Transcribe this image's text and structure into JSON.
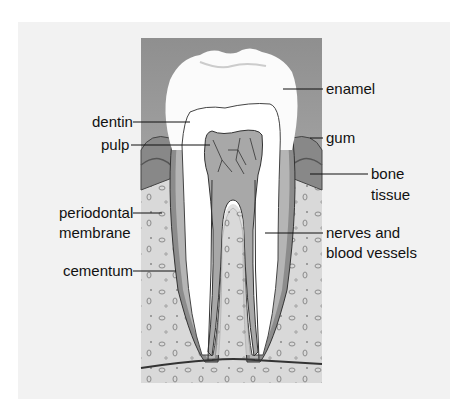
{
  "diagram": {
    "labels": {
      "enamel": "enamel",
      "dentin": "dentin",
      "gum": "gum",
      "pulp": "pulp",
      "bone_tissue_1": "bone",
      "bone_tissue_2": "tissue",
      "periodontal_1": "periodontal",
      "periodontal_2": "membrane",
      "nerves_1": "nerves and",
      "nerves_2": "blood vessels",
      "cementum": "cementum"
    },
    "colors": {
      "background": "#f2f2f2",
      "gum_bg": "#9a9a9a",
      "enamel": "#ffffff",
      "bone": "#d9d9d9",
      "root_layer": "#8c8c8c",
      "pulp": "#a8a8a8"
    }
  }
}
